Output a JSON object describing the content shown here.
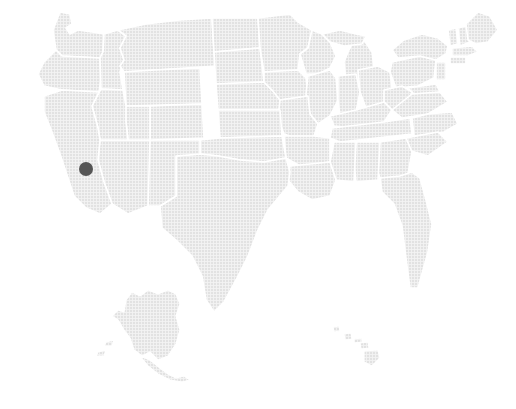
{
  "canvas": {
    "width": 516,
    "height": 409,
    "background_color": "#ffffff"
  },
  "map": {
    "name": "united-states-choropleth",
    "region": "United States of America",
    "projection_style": "albers-usa",
    "land_fill_color": "#e2e2e2",
    "land_texture": "fine-crosshatch-dither",
    "texture_line_color": "#f4f4f4",
    "border_color": "#ffffff",
    "border_width_px": 1.6,
    "has_labels": false,
    "has_legend": false,
    "has_title": false,
    "has_axes": false,
    "insets": [
      {
        "name": "alaska",
        "label": "Alaska"
      },
      {
        "name": "hawaii",
        "label": "Hawaii"
      }
    ]
  },
  "markers": [
    {
      "name": "location-marker-california",
      "shape": "circle",
      "x": 86,
      "y": 169,
      "radius": 7,
      "color": "#555555",
      "state": "California"
    }
  ],
  "chart_data": {
    "type": "map",
    "title": "",
    "subtitle": "",
    "xlabel": "",
    "ylabel": "",
    "legend": [],
    "annotations": [],
    "grid": false,
    "regions_highlighted": [],
    "points": [
      {
        "label": "",
        "state": "California",
        "x": 86,
        "y": 169,
        "value": 1
      }
    ],
    "base_color": "#e2e2e2",
    "point_color": "#555555"
  }
}
